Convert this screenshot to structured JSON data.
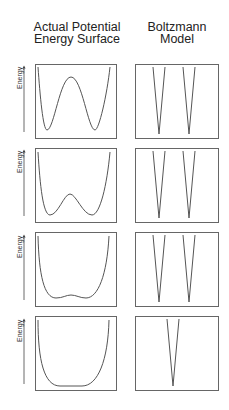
{
  "columns": {
    "left": {
      "line1": "Actual Potential",
      "line2": "Energy Surface"
    },
    "right": {
      "line1": "Boltzmann",
      "line2": "Model"
    }
  },
  "axis_label": "Energy",
  "panels": [
    {
      "id": 1,
      "surface": "double-well with high barrier",
      "boltzmann": "two narrow wells"
    },
    {
      "id": 2,
      "surface": "double-well with lower barrier",
      "boltzmann": "two narrow wells"
    },
    {
      "id": 3,
      "surface": "double-well with very small barrier (flat bottom)",
      "boltzmann": "two narrow wells"
    },
    {
      "id": 4,
      "surface": "single wide flat-bottomed well",
      "boltzmann": "one narrow well"
    }
  ],
  "colors": {
    "line": "#555555",
    "box": "#666666",
    "text": "#222222"
  }
}
